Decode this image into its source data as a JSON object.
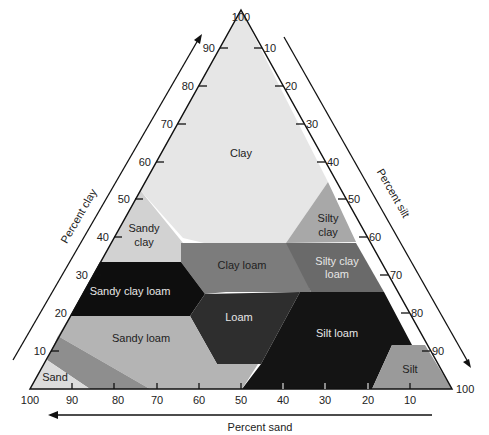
{
  "axes": {
    "clay": {
      "title": "Percent clay",
      "ticks": [
        "10",
        "20",
        "30",
        "40",
        "50",
        "60",
        "70",
        "80",
        "90",
        "100"
      ]
    },
    "silt": {
      "title": "Percent silt",
      "ticks": [
        "10",
        "20",
        "30",
        "40",
        "50",
        "60",
        "70",
        "80",
        "90",
        "100"
      ]
    },
    "sand": {
      "title": "Percent sand",
      "ticks": [
        "100",
        "90",
        "80",
        "70",
        "60",
        "50",
        "40",
        "30",
        "20",
        "10"
      ]
    }
  },
  "regions": [
    {
      "name": "Clay",
      "lines": [
        "Clay"
      ],
      "color": "#e6e6e6",
      "text_color": "#222222"
    },
    {
      "name": "Sandy clay",
      "lines": [
        "Sandy",
        "clay"
      ],
      "color": "#d2d2d2",
      "text_color": "#222222"
    },
    {
      "name": "Silty clay",
      "lines": [
        "Silty",
        "clay"
      ],
      "color": "#a8a8a8",
      "text_color": "#222222"
    },
    {
      "name": "Clay loam",
      "lines": [
        "Clay loam"
      ],
      "color": "#7c7c7c",
      "text_color": "#222222"
    },
    {
      "name": "Silty clay loam",
      "lines": [
        "Silty clay",
        "loam"
      ],
      "color": "#6a6a6a",
      "text_color": "#e6e6e6"
    },
    {
      "name": "Sandy clay loam",
      "lines": [
        "Sandy clay loam"
      ],
      "color": "#0e0e0e",
      "text_color": "#e6e6e6"
    },
    {
      "name": "Loam",
      "lines": [
        "Loam"
      ],
      "color": "#2e2e2e",
      "text_color": "#e6e6e6"
    },
    {
      "name": "Silt loam",
      "lines": [
        "Silt loam"
      ],
      "color": "#141414",
      "text_color": "#e6e6e6"
    },
    {
      "name": "Sandy loam",
      "lines": [
        "Sandy loam"
      ],
      "color": "#b4b4b4",
      "text_color": "#222222"
    },
    {
      "name": "Loamy sand",
      "lines": [
        ""
      ],
      "color": "#8e8e8e",
      "text_color": "#222222"
    },
    {
      "name": "Sand",
      "lines": [
        "Sand"
      ],
      "color": "#dcdcdc",
      "text_color": "#222222"
    },
    {
      "name": "Silt",
      "lines": [
        "Silt"
      ],
      "color": "#9a9a9a",
      "text_color": "#222222"
    }
  ]
}
